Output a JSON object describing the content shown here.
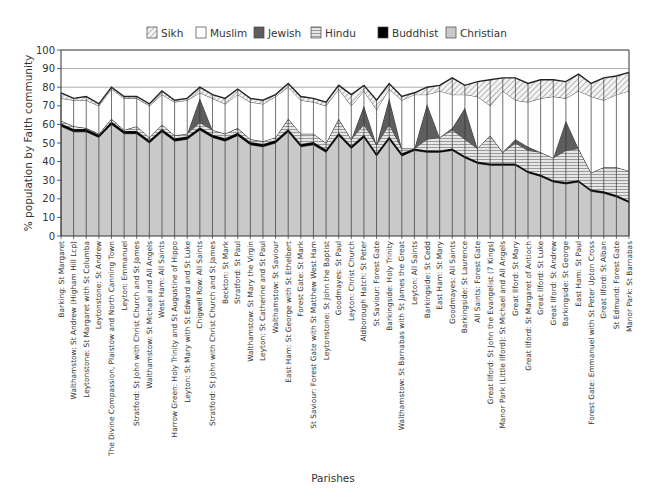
{
  "chart_data": {
    "type": "area",
    "stacked": true,
    "title_fragment": "",
    "xlabel": "Parishes",
    "ylabel": "% population by Faith community",
    "ylim": [
      0,
      100
    ],
    "yticks": [
      0,
      10,
      20,
      30,
      40,
      50,
      60,
      70,
      80,
      90,
      100
    ],
    "grid": true,
    "legend_position": "top",
    "legend": [
      "Sikh",
      "Muslim",
      "Jewish",
      "Hindu",
      "Buddhist",
      "Christian"
    ],
    "categories": [
      "Barking: St Margaret",
      "Walthamstow: St Andrew (Higham Hill Lcp)",
      "Leytonstone: St Margaret with St Columba",
      "Leytonstone: St Andrew",
      "The Divine Compassion, Plaistow and North Canning Town",
      "Leyton: Emmanuel",
      "Stratford: St John with Christ Church and St James",
      "Walthamstow: St Michael and All Angels",
      "West Ham: All Saints",
      "Harrow Green: Holy Trinity and St Augustine of Hippo",
      "Leyton: St Mary with St Edward and St Luke",
      "Chigwell Row: All Saints",
      "Stratford: St John with Christ Church and St James",
      "Beckton: St Mark",
      "Stratford: St Paul",
      "Walthamstow: St Mary the Virgin",
      "Leyton: St Catherine and St Paul",
      "Walthamstow: St Saviour",
      "East Ham: St George with St Ethelbert",
      "Forest Gate: St Mark",
      "St Saviour: Forest Gate with St Matthew West Ham",
      "Leytonstone: St John the Baptist",
      "Goodmayes: St Paul",
      "Leyton: Christ Church",
      "Aldborough Hatch: St Peter",
      "St Saviour: Forest Gate",
      "Barkingside: Holy Trinity",
      "Walthamstow: St Barnabas with St James the Great",
      "Leyton: All Saints",
      "Barkingside: St Cedd",
      "East Ham: St Mary",
      "Goodmayes: All Saints",
      "Barkingside: St Laurence",
      "All Saints: Forest Gate",
      "Great Ilford: St John the Evangelist (7 Kings)",
      "Manor Park (Little Ilford): St Michael and All Angels",
      "Great Ilford: St Mary",
      "Great Ilford: St Margaret of Antioch",
      "Great Ilford: St Luke",
      "Great Ilford: St Andrew",
      "Barkingside: St George",
      "East Ham: St Paul",
      "Forest Gate: Emmanuel with St Peter Upton Cross",
      "Great Ilford: St Alban",
      "St Edmund: Forest Gate",
      "Manor Park: St Barnabas"
    ],
    "series": [
      {
        "name": "Christian",
        "color": "#c8c8c8",
        "pattern": "solid-grey",
        "values": [
          59,
          56,
          56,
          53,
          60,
          55,
          55,
          50,
          56,
          51,
          52,
          57,
          53,
          51,
          54,
          49,
          48,
          50,
          56,
          48,
          49,
          45,
          54,
          47,
          53,
          43,
          52,
          43,
          46,
          45,
          45,
          46,
          42,
          39,
          38,
          38,
          38,
          34,
          32,
          29,
          28,
          29,
          24,
          23,
          21,
          18
        ]
      },
      {
        "name": "Buddhist",
        "color": "#000000",
        "pattern": "solid-black",
        "values": [
          1.5,
          1.5,
          1.5,
          1.5,
          1.5,
          1.5,
          1.5,
          1.5,
          1.5,
          1.5,
          1.5,
          1.5,
          1.5,
          1.5,
          1.5,
          1.5,
          1.5,
          1.5,
          1.5,
          1.5,
          1.5,
          1.5,
          1.5,
          1.5,
          1.5,
          1.5,
          1.5,
          1.5,
          1.0,
          1.0,
          1.0,
          1.0,
          1.0,
          1.0,
          1.0,
          1.0,
          1.0,
          1.0,
          1.0,
          1.0,
          1.0,
          1.0,
          1.0,
          1.0,
          1.0,
          1.0
        ]
      },
      {
        "name": "Hindu",
        "color": "#e8e8e8",
        "pattern": "horizontal-lines",
        "values": [
          1.5,
          1.5,
          0.5,
          0.5,
          1.5,
          0.5,
          2.5,
          1.5,
          2.5,
          1.5,
          1.5,
          2.5,
          2.5,
          2.5,
          2.5,
          1.5,
          1.5,
          1.5,
          5.5,
          5.5,
          4.5,
          3.5,
          7.5,
          3.5,
          5.5,
          4.5,
          6.5,
          2.5,
          0,
          6,
          7,
          10,
          9,
          7,
          15,
          6,
          11,
          11,
          12,
          12,
          17,
          17,
          9,
          13,
          15,
          16
        ]
      },
      {
        "name": "Jewish",
        "color": "#666666",
        "pattern": "solid-dark-grey",
        "values": [
          0,
          0,
          0,
          0,
          0,
          0,
          0,
          0,
          0,
          0,
          0,
          13,
          0,
          0,
          0,
          0,
          0,
          0,
          0,
          0,
          0,
          0,
          0,
          0,
          10,
          0,
          14,
          0,
          0,
          19,
          0,
          1,
          17,
          0,
          0,
          0,
          2,
          2,
          0,
          0,
          16,
          0,
          0,
          0,
          0,
          0
        ]
      },
      {
        "name": "Muslim",
        "color": "#ffffff",
        "pattern": "solid-white",
        "values": [
          12,
          14,
          15,
          15,
          16,
          17,
          15,
          17,
          16,
          18,
          18,
          3,
          17,
          16,
          18,
          20,
          20,
          22,
          17,
          18,
          17,
          20,
          16,
          18,
          8,
          19,
          5,
          26,
          29,
          5,
          25,
          18,
          7,
          28,
          16,
          33,
          21,
          24,
          29,
          33,
          12,
          31,
          41,
          36,
          39,
          43
        ]
      },
      {
        "name": "Sikh",
        "color": "#f2f2f2",
        "pattern": "diagonal-hatch",
        "values": [
          3,
          1,
          2,
          1,
          1,
          1,
          1,
          1,
          2,
          1,
          1,
          3,
          2,
          3,
          3,
          2,
          2,
          1,
          2,
          2,
          2,
          2,
          2,
          6,
          3,
          5,
          3,
          2,
          1,
          4,
          3,
          9,
          5,
          8,
          14,
          7,
          12,
          10,
          10,
          9,
          9,
          9,
          7,
          12,
          10,
          10
        ]
      }
    ]
  },
  "legend_items": [
    {
      "label": "Sikh",
      "swatch": "diagonal-hatch"
    },
    {
      "label": "Muslim",
      "swatch": "white"
    },
    {
      "label": "Jewish",
      "swatch": "dark-grey"
    },
    {
      "label": "Hindu",
      "swatch": "horizontal-lines"
    },
    {
      "label": "Buddhist",
      "swatch": "black"
    },
    {
      "label": "Christian",
      "swatch": "light-grey"
    }
  ],
  "axes": {
    "y_title": "% population by Faith community",
    "x_title": "Parishes"
  }
}
